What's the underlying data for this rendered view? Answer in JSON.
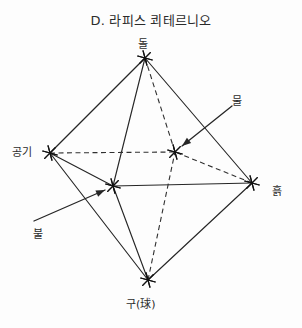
{
  "title": "D. 라피스 쾨테르니오",
  "diagram": {
    "type": "octahedron-quaternio",
    "width": 302,
    "height": 328,
    "node_marker": "asterisk-star",
    "nodes": [
      {
        "id": "top",
        "label": "돌",
        "x": 145,
        "y": 58,
        "label_x": 138,
        "label_y": 39
      },
      {
        "id": "left",
        "label": "공기",
        "x": 50,
        "y": 153,
        "label_x": 12,
        "label_y": 147
      },
      {
        "id": "right",
        "label": "흙",
        "x": 252,
        "y": 183,
        "label_x": 272,
        "label_y": 186
      },
      {
        "id": "bottom",
        "label": "구(球)",
        "x": 148,
        "y": 280,
        "label_x": 126,
        "label_y": 299
      },
      {
        "id": "back-center",
        "label": "물",
        "x": 175,
        "y": 152,
        "label_x": 232,
        "label_y": 96
      },
      {
        "id": "front-center",
        "label": "불",
        "x": 113,
        "y": 186,
        "label_x": 33,
        "label_y": 229
      }
    ],
    "edges": [
      {
        "from": "top",
        "to": "left",
        "style": "solid"
      },
      {
        "from": "top",
        "to": "right",
        "style": "solid"
      },
      {
        "from": "top",
        "to": "front-center",
        "style": "solid"
      },
      {
        "from": "top",
        "to": "back-center",
        "style": "dashed"
      },
      {
        "from": "left",
        "to": "front-center",
        "style": "solid"
      },
      {
        "from": "left",
        "to": "bottom",
        "style": "solid"
      },
      {
        "from": "left",
        "to": "back-center",
        "style": "dashed"
      },
      {
        "from": "right",
        "to": "bottom",
        "style": "solid"
      },
      {
        "from": "right",
        "to": "front-center",
        "style": "solid"
      },
      {
        "from": "right",
        "to": "back-center",
        "style": "dashed"
      },
      {
        "from": "bottom",
        "to": "front-center",
        "style": "solid"
      },
      {
        "from": "bottom",
        "to": "back-center",
        "style": "dashed"
      }
    ],
    "annotations": [
      {
        "id": "water-pointer",
        "label": "물",
        "tail_x": 232,
        "tail_y": 106,
        "head_x": 182,
        "head_y": 146
      },
      {
        "id": "fire-pointer",
        "label": "불",
        "tail_x": 34,
        "tail_y": 221,
        "head_x": 105,
        "head_y": 190
      }
    ]
  },
  "colors": {
    "ink": "#262626",
    "background": "#fdfdfd",
    "text": "#2b2b2b"
  }
}
